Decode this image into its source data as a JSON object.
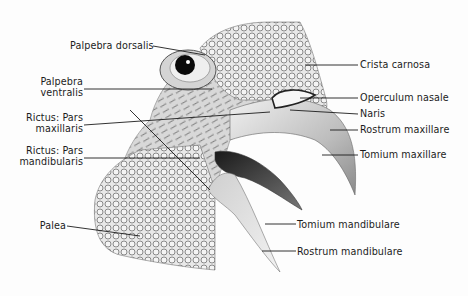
{
  "figure": {
    "labels_left": [
      {
        "id": "palpebra-dorsalis",
        "lines": [
          "Palpebra dorsalis"
        ]
      },
      {
        "id": "palpebra-ventralis",
        "lines": [
          "Palpebra",
          "ventralis"
        ]
      },
      {
        "id": "rictus-pars-maxillaris",
        "lines": [
          "Rictus: Pars",
          "maxillaris"
        ]
      },
      {
        "id": "rictus-pars-mandibularis",
        "lines": [
          "Rictus: Pars",
          "mandibularis"
        ]
      },
      {
        "id": "palea",
        "lines": [
          "Palea"
        ]
      }
    ],
    "labels_right": [
      {
        "id": "crista-carnosa",
        "lines": [
          "Crista carnosa"
        ]
      },
      {
        "id": "operculum-nasale",
        "lines": [
          "Operculum nasale"
        ]
      },
      {
        "id": "naris",
        "lines": [
          "Naris"
        ]
      },
      {
        "id": "rostrum-maxillare",
        "lines": [
          "Rostrum maxillare"
        ]
      },
      {
        "id": "tomium-maxillare",
        "lines": [
          "Tomium maxillare"
        ]
      },
      {
        "id": "tomium-mandibulare",
        "lines": [
          "Tomium mandibulare"
        ]
      },
      {
        "id": "rostrum-mandibulare",
        "lines": [
          "Rostrum mandibulare"
        ]
      }
    ],
    "colors": {
      "ink": "#1c1c1c",
      "background": "#fdfdfd",
      "shading": "#9a9a9a",
      "beak_dark": "#2a2a2a"
    }
  }
}
